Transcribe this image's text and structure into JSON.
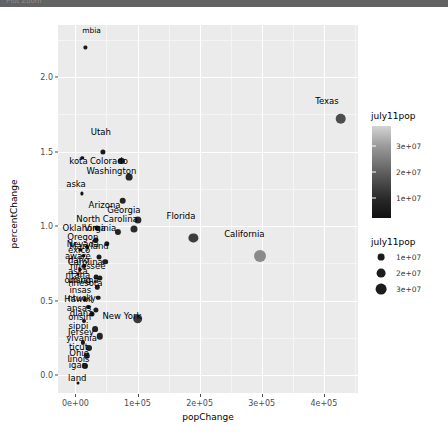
{
  "window": {
    "titlebar_text": "Plot Zoom"
  },
  "chart_data": {
    "type": "scatter",
    "title": "",
    "xlabel": "popChange",
    "ylabel": "percentChange",
    "xlim": [
      -28000,
      455000
    ],
    "ylim": [
      -0.12,
      2.35
    ],
    "grid": true,
    "x_ticks": [
      {
        "value": 0,
        "label": "0e+00"
      },
      {
        "value": 100000,
        "label": "1e+05"
      },
      {
        "value": 200000,
        "label": "2e+05"
      },
      {
        "value": 300000,
        "label": "3e+05"
      },
      {
        "value": 400000,
        "label": "4e+05"
      }
    ],
    "y_ticks": [
      {
        "value": 0.0,
        "label": "0.0"
      },
      {
        "value": 0.5,
        "label": "0.5"
      },
      {
        "value": 1.0,
        "label": "1.0"
      },
      {
        "value": 1.5,
        "label": "1.5"
      },
      {
        "value": 2.0,
        "label": "2.0"
      }
    ],
    "encodings": {
      "x": "popChange",
      "y": "percentChange",
      "color": "july11pop",
      "size": "july11pop",
      "label": "state"
    },
    "legends": [
      {
        "kind": "colorbar",
        "title": "july11pop",
        "position": "right",
        "ticks": [
          "3e+07",
          "2e+07",
          "1e+07"
        ],
        "low_color": "#111111",
        "high_color": "#d4d4d4"
      },
      {
        "kind": "size",
        "title": "july11pop",
        "position": "right",
        "entries": [
          {
            "label": "1e+07",
            "radius": 3.4
          },
          {
            "label": "2e+07",
            "radius": 4.4
          },
          {
            "label": "3e+07",
            "radius": 5.4
          }
        ]
      }
    ],
    "points": [
      {
        "state": "District of Columbia",
        "label": "mbia",
        "x": 16000,
        "y": 2.2,
        "r": 1.6,
        "color": "#1a1a1a",
        "lx": 26000,
        "ly": 2.31,
        "fs": 7.5,
        "anchor": "center"
      },
      {
        "state": "Texas",
        "label": "Texas",
        "x": 427000,
        "y": 1.72,
        "r": 5.3,
        "color": "#4d4d4d",
        "lx": 405000,
        "ly": 1.84,
        "fs": 8.5,
        "anchor": "center"
      },
      {
        "state": "Utah",
        "label": "Utah",
        "x": 44000,
        "y": 1.5,
        "r": 2.6,
        "color": "#1a1a1a",
        "lx": 41000,
        "ly": 1.63,
        "fs": 8.5,
        "anchor": "center"
      },
      {
        "state": "North Dakota",
        "label": "kota",
        "x": 11000,
        "y": 1.46,
        "r": 1.7,
        "color": "#141414",
        "lx": 5000,
        "ly": 1.44,
        "fs": 8.5,
        "anchor": "center"
      },
      {
        "state": "Colorado",
        "label": "Colorado",
        "x": 74000,
        "y": 1.44,
        "r": 3.1,
        "color": "#1f1f1f",
        "lx": 54000,
        "ly": 1.44,
        "fs": 8.5,
        "anchor": "center"
      },
      {
        "state": "Washington",
        "label": "Washington",
        "x": 86000,
        "y": 1.33,
        "r": 3.4,
        "color": "#272727",
        "lx": 58000,
        "ly": 1.37,
        "fs": 8.5,
        "anchor": "center"
      },
      {
        "state": "Alaska",
        "label": "aska",
        "x": 10000,
        "y": 1.22,
        "r": 1.6,
        "color": "#141414",
        "lx": 1000,
        "ly": 1.28,
        "fs": 8.5,
        "anchor": "center"
      },
      {
        "state": "Arizona",
        "label": "Arizona",
        "x": 76000,
        "y": 1.17,
        "r": 3.3,
        "color": "#242424",
        "lx": 47000,
        "ly": 1.14,
        "fs": 8.5,
        "anchor": "center"
      },
      {
        "state": "Georgia",
        "label": "Georgia",
        "x": 101000,
        "y": 1.04,
        "r": 3.6,
        "color": "#2c2c2c",
        "lx": 78000,
        "ly": 1.11,
        "fs": 8.5,
        "anchor": "center"
      },
      {
        "state": "North Carolina",
        "label": "North Carolina",
        "x": 94000,
        "y": 0.98,
        "r": 3.5,
        "color": "#2b2b2b",
        "lx": 51000,
        "ly": 1.05,
        "fs": 8.5,
        "anchor": "center"
      },
      {
        "state": "Oklahoma",
        "label": "Oklahoma",
        "x": 34000,
        "y": 0.99,
        "r": 2.5,
        "color": "#1c1c1c",
        "lx": 14000,
        "ly": 0.99,
        "fs": 8.5,
        "anchor": "center"
      },
      {
        "state": "Virginia",
        "label": "Virginia",
        "x": 69000,
        "y": 0.96,
        "r": 3.1,
        "color": "#232323",
        "lx": 40000,
        "ly": 0.99,
        "fs": 8.5,
        "anchor": "center"
      },
      {
        "state": "Oregon",
        "label": "Oregon",
        "x": 33000,
        "y": 0.91,
        "r": 2.5,
        "color": "#1d1d1d",
        "lx": 12000,
        "ly": 0.93,
        "fs": 8.5,
        "anchor": "center"
      },
      {
        "state": "Nevada",
        "label": "Nevada",
        "x": 31000,
        "y": 0.9,
        "r": 2.2,
        "color": "#191919",
        "lx": 12000,
        "ly": 0.88,
        "fs": 8.5,
        "anchor": "center"
      },
      {
        "state": "Maryland",
        "label": "Maryland",
        "x": 51000,
        "y": 0.88,
        "r": 2.7,
        "color": "#1f1f1f",
        "lx": 22000,
        "ly": 0.87,
        "fs": 8.5,
        "anchor": "center"
      },
      {
        "state": "New Mexico",
        "label": "exico",
        "x": 19000,
        "y": 0.86,
        "r": 2.0,
        "color": "#181818",
        "lx": 6000,
        "ly": 0.84,
        "fs": 8.5,
        "anchor": "center"
      },
      {
        "state": "Delaware",
        "label": "aware",
        "x": 8000,
        "y": 0.84,
        "r": 1.6,
        "color": "#141414",
        "lx": 4000,
        "ly": 0.8,
        "fs": 8.5,
        "anchor": "center"
      },
      {
        "state": "Idaho",
        "label": "daho",
        "x": 13000,
        "y": 0.8,
        "r": 1.7,
        "color": "#151515",
        "lx": 5000,
        "ly": 0.77,
        "fs": 8.5,
        "anchor": "center"
      },
      {
        "state": "South Carolina",
        "label": "Carolina",
        "x": 38000,
        "y": 0.79,
        "r": 2.5,
        "color": "#1d1d1d",
        "lx": 16000,
        "ly": 0.76,
        "fs": 8.5,
        "anchor": "center"
      },
      {
        "state": "Tennessee",
        "label": "nnessee",
        "x": 48000,
        "y": 0.76,
        "r": 2.8,
        "color": "#202020",
        "lx": 20000,
        "ly": 0.73,
        "fs": 8.5,
        "anchor": "center"
      },
      {
        "state": "Nebraska",
        "label": "aska",
        "x": 14000,
        "y": 0.73,
        "r": 1.9,
        "color": "#161616",
        "lx": 4000,
        "ly": 0.7,
        "fs": 8.5,
        "anchor": "center"
      },
      {
        "state": "Montana",
        "label": "ntana",
        "x": 7000,
        "y": 0.71,
        "r": 1.6,
        "color": "#141414",
        "lx": 4000,
        "ly": 0.67,
        "fs": 8.5,
        "anchor": "center"
      },
      {
        "state": "Florida",
        "label": "Florida",
        "x": 190000,
        "y": 0.92,
        "r": 4.6,
        "color": "#3c3c3c",
        "lx": 170000,
        "ly": 1.07,
        "fs": 8.5,
        "anchor": "center"
      },
      {
        "state": "Wyoming",
        "label": "oming",
        "x": 5000,
        "y": 0.68,
        "r": 1.5,
        "color": "#131313",
        "lx": 4000,
        "ly": 0.64,
        "fs": 8.5,
        "anchor": "center"
      },
      {
        "state": "Louisiana",
        "label": "uisiana",
        "x": 33000,
        "y": 0.66,
        "r": 2.4,
        "color": "#1c1c1c",
        "lx": 13000,
        "ly": 0.64,
        "fs": 8.5,
        "anchor": "center"
      },
      {
        "state": "Minnesota",
        "label": "nnesota",
        "x": 40000,
        "y": 0.65,
        "r": 2.6,
        "color": "#1e1e1e",
        "lx": 16000,
        "ly": 0.62,
        "fs": 8.5,
        "anchor": "center"
      },
      {
        "state": "Arkansas",
        "label": "insas",
        "x": 35000,
        "y": 0.59,
        "r": 2.2,
        "color": "#1a1a1a",
        "lx": 8000,
        "ly": 0.57,
        "fs": 8.5,
        "anchor": "center"
      },
      {
        "state": "Kentucky",
        "label": "ntucky",
        "x": 37000,
        "y": 0.52,
        "r": 2.3,
        "color": "#1b1b1b",
        "lx": 10000,
        "ly": 0.52,
        "fs": 8.5,
        "anchor": "center"
      },
      {
        "state": "Hawaii",
        "label": "Hawaii",
        "x": 15000,
        "y": 0.51,
        "r": 1.8,
        "color": "#151515",
        "lx": 5000,
        "ly": 0.51,
        "fs": 8.5,
        "anchor": "center"
      },
      {
        "state": "Kansas",
        "label": "ansas",
        "x": 21000,
        "y": 0.46,
        "r": 2.1,
        "color": "#181818",
        "lx": 6000,
        "ly": 0.45,
        "fs": 8.5,
        "anchor": "center"
      },
      {
        "state": "Indiana",
        "label": "diana",
        "x": 33000,
        "y": 0.44,
        "r": 2.6,
        "color": "#1e1e1e",
        "lx": 10000,
        "ly": 0.42,
        "fs": 8.5,
        "anchor": "center"
      },
      {
        "state": "Wisconsin",
        "label": "onsin",
        "x": 26000,
        "y": 0.41,
        "r": 2.5,
        "color": "#1d1d1d",
        "lx": 7000,
        "ly": 0.39,
        "fs": 8.5,
        "anchor": "center"
      },
      {
        "state": "New York",
        "label": "New York",
        "x": 100000,
        "y": 0.38,
        "r": 4.8,
        "color": "#3a3a3a",
        "lx": 75000,
        "ly": 0.4,
        "fs": 8.5,
        "anchor": "center"
      },
      {
        "state": "Mississippi",
        "label": "sippi",
        "x": 14000,
        "y": 0.36,
        "r": 2.0,
        "color": "#171717",
        "lx": 5000,
        "ly": 0.33,
        "fs": 8.5,
        "anchor": "center"
      },
      {
        "state": "New Jersey",
        "label": "Jersey",
        "x": 32000,
        "y": 0.31,
        "r": 2.9,
        "color": "#212121",
        "lx": 9000,
        "ly": 0.29,
        "fs": 8.5,
        "anchor": "center"
      },
      {
        "state": "Pennsylvania",
        "label": "ylvania",
        "x": 39000,
        "y": 0.26,
        "r": 3.2,
        "color": "#252525",
        "lx": 10000,
        "ly": 0.25,
        "fs": 8.5,
        "anchor": "center"
      },
      {
        "state": "Connecticut",
        "label": "ticut",
        "x": 12000,
        "y": 0.22,
        "r": 2.1,
        "color": "#181818",
        "lx": 5000,
        "ly": 0.19,
        "fs": 8.5,
        "anchor": "center"
      },
      {
        "state": "Ohio",
        "label": "Ohio",
        "x": 22000,
        "y": 0.18,
        "r": 3.0,
        "color": "#222222",
        "lx": 6000,
        "ly": 0.15,
        "fs": 8.5,
        "anchor": "center"
      },
      {
        "state": "Illinois",
        "label": "linois",
        "x": 18000,
        "y": 0.13,
        "r": 3.2,
        "color": "#252525",
        "lx": 5000,
        "ly": 0.11,
        "fs": 8.5,
        "anchor": "center"
      },
      {
        "state": "Michigan",
        "label": "igan",
        "x": 15000,
        "y": 0.06,
        "r": 3.0,
        "color": "#232323",
        "lx": 4000,
        "ly": 0.07,
        "fs": 8.5,
        "anchor": "center"
      },
      {
        "state": "Rhode Island",
        "label": "land",
        "x": 4000,
        "y": -0.05,
        "r": 1.5,
        "color": "#131313",
        "lx": 3000,
        "ly": -0.02,
        "fs": 8.5,
        "anchor": "center"
      },
      {
        "state": "California",
        "label": "California",
        "x": 298000,
        "y": 0.8,
        "r": 6.0,
        "color": "#8a8a8a",
        "lx": 272000,
        "ly": 0.95,
        "fs": 8.5,
        "anchor": "center"
      }
    ]
  }
}
